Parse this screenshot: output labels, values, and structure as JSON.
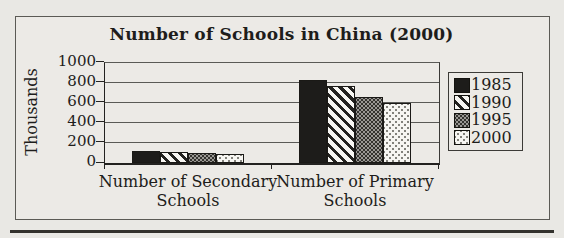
{
  "chart_data": {
    "type": "bar",
    "title": "Number of Schools in China (2000)",
    "ylabel": "Thousands",
    "categories": [
      "Number of Secondary Schools",
      "Number of Primary Schools"
    ],
    "series": [
      {
        "name": "1985",
        "pattern": "solid-black",
        "values": [
          125,
          835
        ]
      },
      {
        "name": "1990",
        "pattern": "diagonal-stripes",
        "values": [
          110,
          770
        ]
      },
      {
        "name": "1995",
        "pattern": "dark-checker",
        "values": [
          100,
          660
        ]
      },
      {
        "name": "2000",
        "pattern": "light-dots",
        "values": [
          90,
          600
        ]
      }
    ],
    "ylim": [
      0,
      1000
    ],
    "yticks": [
      0,
      200,
      400,
      600,
      800,
      1000
    ],
    "grid": true,
    "legend_position": "right",
    "colors": {
      "background": "#e9e8e4",
      "bar_solid": "#1d1c1a",
      "axis": "#232220",
      "gridline": "#5a5a56",
      "frame_border": "#5b5a55"
    }
  }
}
